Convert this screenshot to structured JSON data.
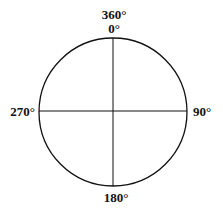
{
  "diagram": {
    "type": "compass-circle",
    "labels": {
      "top_outer": "360°",
      "top_inner": "0°",
      "right": "90°",
      "bottom": "180°",
      "left": "270°"
    },
    "stroke_color": "#111111",
    "background": "#ffffff"
  }
}
